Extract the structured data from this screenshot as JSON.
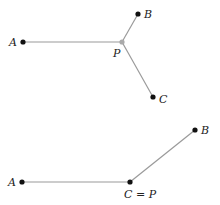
{
  "colors": {
    "point": "#111111",
    "fermat_point": "#aaaaaa",
    "segment": "#9a9a9a",
    "label": "#222222"
  },
  "diagrams": [
    {
      "name": "fermat-point-interior",
      "points": [
        {
          "label": "A",
          "x": 23,
          "y": 42
        },
        {
          "label": "B",
          "x": 138,
          "y": 14
        },
        {
          "label": "P",
          "x": 122,
          "y": 42
        },
        {
          "label": "C",
          "x": 153,
          "y": 97
        }
      ],
      "segments": [
        [
          "A",
          "P"
        ],
        [
          "B",
          "P"
        ],
        [
          "C",
          "P"
        ]
      ]
    },
    {
      "name": "fermat-point-at-vertex",
      "points": [
        {
          "label": "A",
          "x": 22,
          "y": 182
        },
        {
          "label": "B",
          "x": 195,
          "y": 130
        },
        {
          "label": "C = P",
          "x": 130,
          "y": 182
        }
      ],
      "segments": [
        [
          "A",
          "C = P"
        ],
        [
          "B",
          "C = P"
        ]
      ]
    }
  ]
}
